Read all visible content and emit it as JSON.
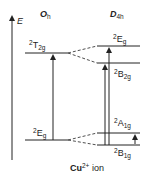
{
  "axis": {
    "label": "E"
  },
  "groups": {
    "left": {
      "main": "O",
      "sub": "h"
    },
    "right": {
      "main": "D",
      "sub": "4h"
    }
  },
  "levels": {
    "oh_t2g": {
      "sup": "2",
      "main": "T",
      "sub": "2g"
    },
    "oh_eg": {
      "sup": "2",
      "main": "E",
      "sub": "g"
    },
    "d4h_eg": {
      "sup": "2",
      "main": "E",
      "sub": "g"
    },
    "d4h_b2g": {
      "sup": "2",
      "main": "B",
      "sub": "2g"
    },
    "d4h_a1g": {
      "sup": "2",
      "main": "A",
      "sub": "1g"
    },
    "d4h_b1g": {
      "sup": "2",
      "main": "B",
      "sub": "1g"
    }
  },
  "caption": {
    "ion": "Cu",
    "charge": "2+",
    "rest": " ion"
  },
  "colors": {
    "line": "#222222",
    "background": "#ffffff"
  }
}
